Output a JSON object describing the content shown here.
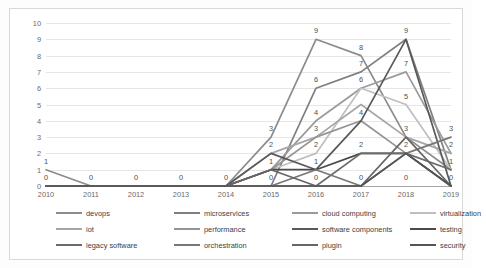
{
  "chart_data": {
    "type": "line",
    "title": "",
    "subtitle": "",
    "xlabel": "",
    "ylabel": "",
    "x": [
      2010,
      2011,
      2012,
      2013,
      2014,
      2015,
      2016,
      2017,
      2018,
      2019
    ],
    "xtick_labels": [
      "2010",
      "2011",
      "2012",
      "2013",
      "2014",
      "2015",
      "2016",
      "2017",
      "2018",
      "2019"
    ],
    "ytick_labels": [
      "0",
      "1",
      "2",
      "3",
      "4",
      "5",
      "6",
      "7",
      "8",
      "9",
      "10"
    ],
    "ylim": [
      0,
      10
    ],
    "ytick_step": 1,
    "grid": true,
    "legend_position": "bottom",
    "legend_columns": 4,
    "data_labels_shown": true,
    "series": [
      {
        "name": "devops",
        "color": "#8c8c8c",
        "values": [
          1,
          0,
          0,
          0,
          0,
          3,
          9,
          8,
          3,
          1
        ]
      },
      {
        "name": "microservices",
        "color": "#7f7f7f",
        "values": [
          0,
          0,
          0,
          0,
          0,
          0,
          6,
          7,
          9,
          1
        ]
      },
      {
        "name": "cloud computing",
        "color": "#9a9a9a",
        "values": [
          0,
          0,
          0,
          0,
          0,
          1,
          4,
          6,
          7,
          2
        ]
      },
      {
        "name": "virtualization",
        "color": "#bfbfbf",
        "values": [
          0,
          0,
          0,
          0,
          0,
          1,
          2,
          6,
          5,
          1
        ]
      },
      {
        "name": "iot",
        "color": "#a6a6a6",
        "values": [
          0,
          0,
          0,
          0,
          0,
          2,
          3,
          5,
          3,
          2
        ]
      },
      {
        "name": "performance",
        "color": "#949494",
        "values": [
          0,
          0,
          0,
          0,
          0,
          1,
          3,
          4,
          2,
          0
        ]
      },
      {
        "name": "software components",
        "color": "#595959",
        "values": [
          0,
          0,
          0,
          0,
          0,
          2,
          1,
          4,
          9,
          0
        ]
      },
      {
        "name": "testing",
        "color": "#4a4a4a",
        "values": [
          0,
          0,
          0,
          0,
          0,
          1,
          1,
          2,
          2,
          0
        ]
      },
      {
        "name": "legacy software",
        "color": "#6b6b6b",
        "values": [
          0,
          0,
          0,
          0,
          0,
          0,
          0,
          2,
          2,
          1
        ]
      },
      {
        "name": "orchestration",
        "color": "#777777",
        "values": [
          0,
          0,
          0,
          0,
          0,
          0,
          1,
          0,
          2,
          3
        ]
      },
      {
        "name": "plugin",
        "color": "#666666",
        "values": [
          0,
          0,
          0,
          0,
          0,
          1,
          0,
          0,
          3,
          0
        ]
      },
      {
        "name": "security",
        "color": "#555555",
        "values": [
          0,
          0,
          0,
          0,
          0,
          0,
          0,
          0,
          2,
          0
        ]
      }
    ],
    "point_labels": [
      {
        "x": 2010,
        "y": 1,
        "text": "1"
      },
      {
        "x": 2010,
        "y": 0,
        "text": "0"
      },
      {
        "x": 2011,
        "y": 0,
        "text": "0"
      },
      {
        "x": 2012,
        "y": 0,
        "text": "0"
      },
      {
        "x": 2013,
        "y": 0,
        "text": "0"
      },
      {
        "x": 2014,
        "y": 0,
        "text": "0"
      },
      {
        "x": 2015,
        "y": 3,
        "text": "3"
      },
      {
        "x": 2015,
        "y": 2,
        "text": "2"
      },
      {
        "x": 2015,
        "y": 1,
        "text": "1"
      },
      {
        "x": 2015,
        "y": 0,
        "text": "0"
      },
      {
        "x": 2016,
        "y": 9,
        "text": "9"
      },
      {
        "x": 2016,
        "y": 6,
        "text": "6"
      },
      {
        "x": 2016,
        "y": 4,
        "text": "4"
      },
      {
        "x": 2016,
        "y": 3,
        "text": "3"
      },
      {
        "x": 2016,
        "y": 2,
        "text": "2"
      },
      {
        "x": 2016,
        "y": 1,
        "text": "1"
      },
      {
        "x": 2016,
        "y": 0,
        "text": "0"
      },
      {
        "x": 2017,
        "y": 8,
        "text": "8"
      },
      {
        "x": 2017,
        "y": 7,
        "text": "7"
      },
      {
        "x": 2017,
        "y": 6,
        "text": "6"
      },
      {
        "x": 2017,
        "y": 4,
        "text": "4"
      },
      {
        "x": 2017,
        "y": 2,
        "text": "2"
      },
      {
        "x": 2017,
        "y": 0,
        "text": "0"
      },
      {
        "x": 2018,
        "y": 9,
        "text": "9"
      },
      {
        "x": 2018,
        "y": 7,
        "text": "7"
      },
      {
        "x": 2018,
        "y": 5,
        "text": "5"
      },
      {
        "x": 2018,
        "y": 3,
        "text": "3"
      },
      {
        "x": 2018,
        "y": 2,
        "text": "2"
      },
      {
        "x": 2018,
        "y": 0,
        "text": "0"
      },
      {
        "x": 2019,
        "y": 3,
        "text": "3"
      },
      {
        "x": 2019,
        "y": 2,
        "text": "2"
      },
      {
        "x": 2019,
        "y": 1,
        "text": "1"
      },
      {
        "x": 2019,
        "y": 0,
        "text": "0"
      }
    ]
  }
}
